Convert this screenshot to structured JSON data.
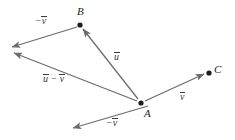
{
  "figure": {
    "background_color": "#ffffff",
    "line_color": "#6b6b6b",
    "point_color": "#1c1c1c",
    "label_color": "#3a3a3a",
    "width": 235,
    "height": 140
  },
  "points": [
    {
      "name": "B",
      "label": "B",
      "x": 80,
      "y": 25,
      "label_x": 77,
      "label_y": 6
    },
    {
      "name": "A",
      "label": "A",
      "x": 141,
      "y": 103,
      "label_x": 144,
      "label_y": 108
    },
    {
      "name": "C",
      "label": "C",
      "x": 209,
      "y": 73,
      "label_x": 214,
      "label_y": 64
    }
  ],
  "vectors": [
    {
      "name": "u",
      "label_main": "u",
      "label_prefix": "",
      "label_x": 114,
      "label_y": 51,
      "from": "A",
      "to": "B",
      "x1": 138,
      "y1": 99,
      "x2": 83,
      "y2": 29
    },
    {
      "name": "minus-v-top",
      "label_main": "v",
      "label_prefix": "−",
      "label_x": 35,
      "label_y": 15,
      "from": "B",
      "to": "tip-upper-left",
      "x1": 77,
      "y1": 27,
      "x2": 12,
      "y2": 47
    },
    {
      "name": "u-minus-v",
      "label_main": "v",
      "label_prefix": "u − ",
      "label_x": 43,
      "label_y": 73,
      "from": "A",
      "to": "tip-lower-left",
      "x1": 137,
      "y1": 101,
      "x2": 14,
      "y2": 53
    },
    {
      "name": "v-right",
      "label_main": "v",
      "label_prefix": "",
      "label_x": 180,
      "label_y": 91,
      "from": "A",
      "to": "C",
      "x1": 145,
      "y1": 101,
      "x2": 204,
      "y2": 74
    },
    {
      "name": "minus-v-bottom",
      "label_main": "v",
      "label_prefix": "−",
      "label_x": 106,
      "label_y": 117,
      "from": "A",
      "to": "tip-bottom-left",
      "x1": 148,
      "y1": 106,
      "x2": 73,
      "y2": 128
    }
  ]
}
